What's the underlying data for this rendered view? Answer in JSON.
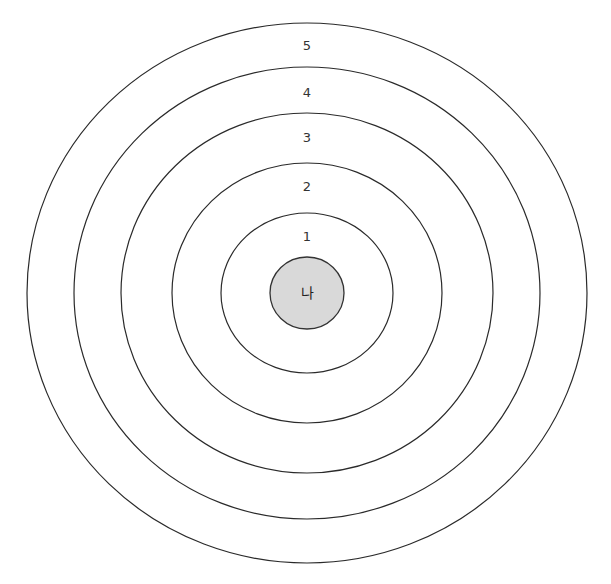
{
  "diagram": {
    "type": "concentric-circles",
    "center": {
      "x": 307,
      "y": 293
    },
    "core": {
      "label": "나",
      "rx": 37,
      "ry": 36,
      "fill": "#d9d9d9"
    },
    "rings": [
      {
        "label": "1",
        "rx": 86,
        "ry": 80,
        "label_y": 236
      },
      {
        "label": "2",
        "rx": 135,
        "ry": 130,
        "label_y": 186
      },
      {
        "label": "3",
        "rx": 186,
        "ry": 180,
        "label_y": 137
      },
      {
        "label": "4",
        "rx": 233,
        "ry": 226,
        "label_y": 92
      },
      {
        "label": "5",
        "rx": 280,
        "ry": 270,
        "label_y": 45
      }
    ],
    "stroke_color": "#2a2a2a"
  }
}
